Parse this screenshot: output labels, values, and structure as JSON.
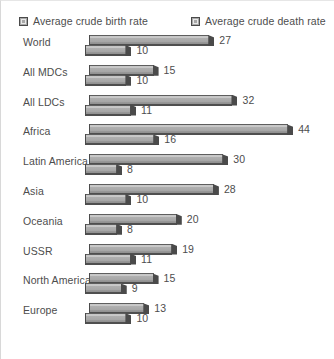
{
  "legend": {
    "birth": {
      "label": "Average crude birth rate",
      "swatch": "legend-swatch-birth"
    },
    "death": {
      "label": "Average crude death rate",
      "swatch": "legend-swatch-death"
    }
  },
  "colors": {
    "bar_light": "#c6c6c6",
    "bar_mid": "#a6a6a6",
    "bar_dark": "#4a4a4a",
    "text": "#4d4d4d",
    "background": "#ffffff"
  },
  "chart_data": {
    "type": "bar",
    "orientation": "horizontal",
    "title": "",
    "subtitle": "",
    "xlabel": "",
    "ylabel": "",
    "grid": false,
    "legend_position": "top",
    "xlim": [
      0,
      44
    ],
    "categories": [
      "World",
      "All MDCs",
      "All LDCs",
      "Africa",
      "Latin America",
      "Asia",
      "Oceania",
      "USSR",
      "North America",
      "Europe"
    ],
    "series": [
      {
        "name": "Average crude birth rate",
        "values": [
          27,
          15,
          32,
          44,
          30,
          28,
          20,
          19,
          15,
          13
        ]
      },
      {
        "name": "Average crude death rate",
        "values": [
          10,
          10,
          11,
          16,
          8,
          10,
          8,
          11,
          9,
          10
        ]
      }
    ]
  }
}
